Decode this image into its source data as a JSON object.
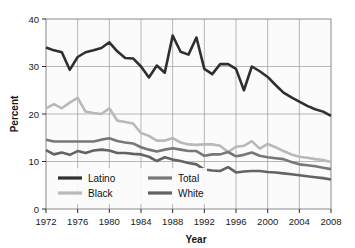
{
  "chart_data": {
    "type": "line",
    "title": "",
    "xlabel": "Year",
    "ylabel": "Percent",
    "xlim": [
      1972,
      2008
    ],
    "ylim": [
      0,
      40
    ],
    "yticks": [
      0,
      10,
      20,
      30,
      40
    ],
    "ytick_labels": [
      "0",
      "10",
      "20",
      "30",
      "40"
    ],
    "xticks": [
      1972,
      1976,
      1980,
      1984,
      1988,
      1992,
      1996,
      2000,
      2004,
      2008
    ],
    "xtick_labels": [
      "1972",
      "1976",
      "1980",
      "1984",
      "1988",
      "1992",
      "1996",
      "2000",
      "2004",
      "2008"
    ],
    "grid": true,
    "legend_position": "bottom-left-inside",
    "x": [
      1972,
      1973,
      1974,
      1975,
      1976,
      1977,
      1978,
      1979,
      1980,
      1981,
      1982,
      1983,
      1984,
      1985,
      1986,
      1987,
      1988,
      1989,
      1990,
      1991,
      1992,
      1993,
      1994,
      1995,
      1996,
      1997,
      1998,
      1999,
      2000,
      2001,
      2002,
      2003,
      2004,
      2005,
      2006,
      2007,
      2008
    ],
    "series": [
      {
        "name": "Latino",
        "color": "#2f2f2f",
        "width": 2.6,
        "values": [
          34.0,
          33.4,
          33.0,
          29.3,
          32.0,
          33.0,
          33.4,
          33.9,
          35.1,
          33.2,
          31.8,
          31.7,
          30.0,
          27.7,
          30.2,
          28.7,
          36.5,
          33.1,
          32.5,
          36.1,
          29.5,
          28.4,
          30.5,
          30.5,
          29.5,
          25.0,
          30.0,
          29.0,
          27.8,
          26.1,
          24.5,
          23.5,
          22.6,
          21.7,
          21.0,
          20.5,
          19.6
        ]
      },
      {
        "name": "Black",
        "color": "#b9b9b9",
        "width": 2.6,
        "values": [
          21.2,
          22.1,
          21.2,
          22.4,
          23.4,
          20.5,
          20.2,
          20.0,
          21.2,
          18.6,
          18.3,
          18.0,
          16.0,
          15.4,
          14.4,
          14.4,
          14.9,
          14.0,
          13.6,
          13.5,
          13.6,
          13.6,
          13.3,
          12.0,
          13.1,
          13.3,
          14.3,
          12.7,
          13.7,
          13.0,
          12.2,
          11.5,
          11.0,
          10.8,
          10.5,
          10.3,
          9.9
        ]
      },
      {
        "name": "Total",
        "color": "#777777",
        "width": 2.6,
        "values": [
          14.6,
          14.2,
          14.2,
          14.2,
          14.2,
          14.2,
          14.2,
          14.6,
          14.9,
          14.3,
          14.0,
          13.8,
          13.0,
          12.5,
          12.1,
          12.5,
          12.8,
          12.5,
          12.2,
          12.2,
          11.2,
          11.5,
          11.5,
          12.0,
          11.1,
          11.4,
          11.9,
          11.2,
          10.9,
          10.7,
          10.5,
          9.9,
          9.4,
          9.2,
          9.0,
          8.7,
          8.4
        ]
      },
      {
        "name": "White",
        "color": "#636363",
        "width": 2.6,
        "values": [
          12.4,
          11.5,
          11.9,
          11.4,
          12.2,
          11.8,
          12.3,
          12.5,
          12.3,
          11.8,
          11.8,
          11.6,
          11.5,
          11.0,
          10.1,
          10.9,
          10.4,
          10.1,
          9.7,
          9.4,
          8.3,
          8.1,
          8.0,
          8.8,
          7.7,
          7.9,
          8.0,
          8.0,
          7.8,
          7.7,
          7.5,
          7.3,
          7.1,
          6.9,
          6.7,
          6.5,
          6.2
        ]
      }
    ],
    "legend": [
      {
        "label": "Latino",
        "color": "#2f2f2f"
      },
      {
        "label": "Black",
        "color": "#b9b9b9"
      },
      {
        "label": "Total",
        "color": "#777777"
      },
      {
        "label": "White",
        "color": "#636363"
      }
    ]
  }
}
